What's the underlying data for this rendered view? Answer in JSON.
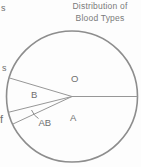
{
  "cropped_text_fragments": {
    "top": "s",
    "middle": "s",
    "bottom": "f"
  },
  "chart_data": {
    "type": "pie",
    "title": "Distribution of Blood Types",
    "title_lines": [
      "Distribution of",
      "Blood Types"
    ],
    "slices": [
      {
        "label": "O",
        "percent_estimated": 45
      },
      {
        "label": "B",
        "percent_estimated": 9
      },
      {
        "label": "AB",
        "percent_estimated": 3
      },
      {
        "label": "A",
        "percent_estimated": 43
      }
    ],
    "boundary_angles_deg_ccw_from_right": [
      0,
      163.5,
      194,
      205
    ],
    "legend": "none",
    "data_labels": "category letters inside slices, AB connected by leader tick",
    "colors": {
      "outline_stroke": "#8d8d8d",
      "slice_line_stroke": "#979797",
      "label_text": "#6f6f6f",
      "title_text": "#7a7a7a",
      "background": "#fdfdfd"
    }
  }
}
